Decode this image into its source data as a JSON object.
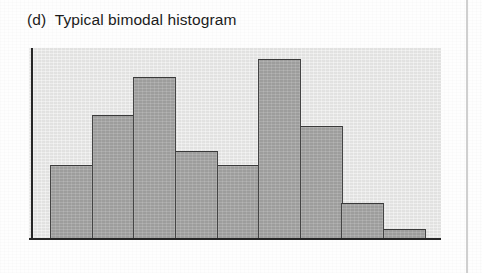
{
  "figure": {
    "caption": "(d)  Typical bimodal histogram",
    "panel_label": "(d)",
    "panel_title": "Typical bimodal histogram"
  },
  "colors": {
    "page_background": "#fefefe",
    "plot_background": "#e7e7e6",
    "bar_fill": "#a6a6a5",
    "bar_outline": "#3a3a3a",
    "axis_line": "#262626",
    "caption_text": "#1b1b1b",
    "column_divider": "#cfcfcf"
  },
  "chart_data": {
    "type": "bar",
    "title": "(d)  Typical bimodal histogram",
    "xlabel": "",
    "ylabel": "",
    "categories": [
      "1",
      "2",
      "3",
      "4",
      "5",
      "6",
      "7",
      "8",
      "9"
    ],
    "values": [
      39,
      65,
      85,
      46,
      39,
      94,
      59,
      19,
      5
    ],
    "ylim": [
      0,
      100
    ],
    "grid": false,
    "legend": null
  }
}
